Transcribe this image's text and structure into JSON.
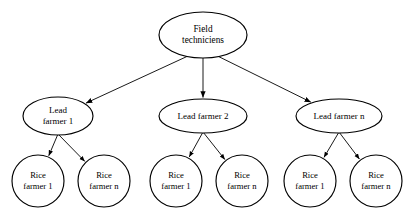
{
  "diagram": {
    "type": "hierarchy-tree",
    "background_color": "#ffffff",
    "line_color": "#000000",
    "node_fill": "#ffffff",
    "root": {
      "id": "field-techniciens",
      "label_line1": "Field",
      "label_line2": "techniciens",
      "shape": "ellipse",
      "cx": 203,
      "cy": 35,
      "rx": 44,
      "ry": 23
    },
    "level2": [
      {
        "id": "lead-farmer-1",
        "label_line1": "Lead",
        "label_line2": "farmer 1",
        "shape": "ellipse",
        "cx": 58,
        "cy": 116,
        "rx": 35,
        "ry": 19
      },
      {
        "id": "lead-farmer-2",
        "label_line1": "Lead farmer 2",
        "label_line2": "",
        "shape": "ellipse",
        "cx": 203,
        "cy": 116,
        "rx": 44,
        "ry": 17
      },
      {
        "id": "lead-farmer-n",
        "label_line1": "Lead farmer n",
        "label_line2": "",
        "shape": "ellipse",
        "cx": 339,
        "cy": 116,
        "rx": 43,
        "ry": 17
      }
    ],
    "level3": [
      {
        "id": "rice-farmer-1-a",
        "label_line1": "Rice",
        "label_line2": "farmer 1",
        "shape": "circle",
        "cx": 38,
        "cy": 181,
        "r": 26,
        "parent": "lead-farmer-1"
      },
      {
        "id": "rice-farmer-n-a",
        "label_line1": "Rice",
        "label_line2": "farmer n",
        "shape": "circle",
        "cx": 104,
        "cy": 181,
        "r": 26,
        "parent": "lead-farmer-1"
      },
      {
        "id": "rice-farmer-1-b",
        "label_line1": "Rice",
        "label_line2": "farmer 1",
        "shape": "circle",
        "cx": 176,
        "cy": 181,
        "r": 26,
        "parent": "lead-farmer-2"
      },
      {
        "id": "rice-farmer-n-b",
        "label_line1": "Rice",
        "label_line2": "farmer n",
        "shape": "circle",
        "cx": 242,
        "cy": 181,
        "r": 26,
        "parent": "lead-farmer-2"
      },
      {
        "id": "rice-farmer-1-c",
        "label_line1": "Rice",
        "label_line2": "farmer 1",
        "shape": "circle",
        "cx": 310,
        "cy": 181,
        "r": 26,
        "parent": "lead-farmer-n"
      },
      {
        "id": "rice-farmer-n-c",
        "label_line1": "Rice",
        "label_line2": "farmer n",
        "shape": "circle",
        "cx": 376,
        "cy": 181,
        "r": 26,
        "parent": "lead-farmer-n"
      }
    ],
    "edges": [
      {
        "id": "edge-root-lead1",
        "from": "field-techniciens",
        "to": "lead-farmer-1",
        "arrow": true
      },
      {
        "id": "edge-root-lead2",
        "from": "field-techniciens",
        "to": "lead-farmer-2",
        "arrow": true
      },
      {
        "id": "edge-root-leadn",
        "from": "field-techniciens",
        "to": "lead-farmer-n",
        "arrow": true
      },
      {
        "id": "edge-lead1-rice1",
        "from": "lead-farmer-1",
        "to": "rice-farmer-1-a",
        "arrow": true
      },
      {
        "id": "edge-lead1-ricen",
        "from": "lead-farmer-1",
        "to": "rice-farmer-n-a",
        "arrow": true
      },
      {
        "id": "edge-lead2-rice1",
        "from": "lead-farmer-2",
        "to": "rice-farmer-1-b",
        "arrow": true
      },
      {
        "id": "edge-lead2-ricen",
        "from": "lead-farmer-2",
        "to": "rice-farmer-n-b",
        "arrow": true
      },
      {
        "id": "edge-leadn-rice1",
        "from": "lead-farmer-n",
        "to": "rice-farmer-1-c",
        "arrow": true
      },
      {
        "id": "edge-leadn-ricen",
        "from": "lead-farmer-n",
        "to": "rice-farmer-n-c",
        "arrow": true
      }
    ]
  }
}
